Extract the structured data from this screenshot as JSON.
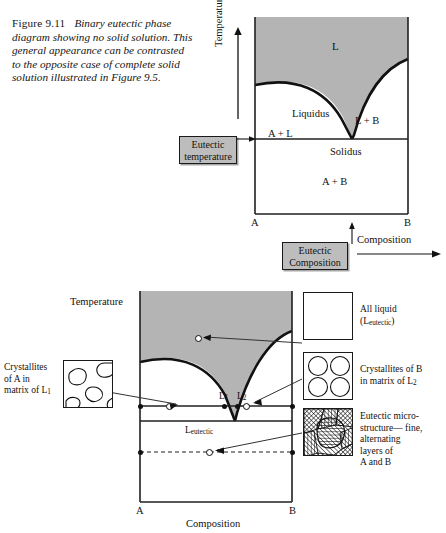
{
  "caption": {
    "figure_number": "Figure 9.11",
    "text": "Binary eutectic phase diagram showing no solid solution. This general appearance can be contrasted to the opposite case of complete solid solution illustrated in Figure 9.5."
  },
  "top_diagram": {
    "y_axis_label": "Temperature",
    "x_axis_label": "Composition",
    "x_left_label": "A",
    "x_right_label": "B",
    "regions": {
      "liquid": "L",
      "liquidus": "Liquidus",
      "a_plus_l": "A + L",
      "l_plus_b": "L + B",
      "solidus": "Solidus",
      "a_plus_b": "A + B"
    },
    "callouts": {
      "eutectic_temperature": "Eutectic temperature",
      "eutectic_temperature_line1": "Eutectic",
      "eutectic_temperature_line2": "temperature",
      "eutectic_composition": "Eutectic Composition",
      "eutectic_composition_line1": "Eutectic",
      "eutectic_composition_line2": "Composition"
    }
  },
  "bottom_diagram": {
    "y_axis_label": "Temperature",
    "x_axis_label": "Composition",
    "x_left_label": "A",
    "x_right_label": "B",
    "labels": {
      "l1": "L",
      "l1_sub": "1",
      "l2": "L",
      "l2_sub": "2",
      "l_eutectic": "L",
      "l_eutectic_sub": "eutectic"
    },
    "annotations": [
      {
        "id": "all-liquid",
        "line1": "All liquid",
        "line2_pre": "(L",
        "line2_sub": "eutectic",
        "line2_post": ")"
      },
      {
        "id": "crystallites-a",
        "line1": "Crystallites",
        "line2": "of A in",
        "line3_pre": "matrix of L",
        "line3_sub": "1"
      },
      {
        "id": "crystallites-b",
        "line1": "Crystallites of B",
        "line2_pre": "in matrix of L",
        "line2_sub": "2"
      },
      {
        "id": "eutectic-microstructure",
        "line1": "Eutectic micro-",
        "line2": "structure— fine,",
        "line3": "alternating",
        "line4": "layers of",
        "line5": "A and B"
      }
    ]
  },
  "colors": {
    "liquid_field": "#b4b4b4",
    "callout_fill": "#bdbdbd",
    "stroke": "#1a1a1a",
    "page_background": "#ffffff"
  }
}
